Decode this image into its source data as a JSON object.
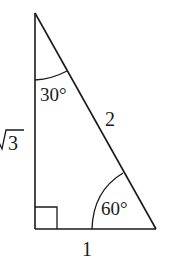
{
  "diagram": {
    "type": "right-triangle",
    "vertices": {
      "top": {
        "x": 35,
        "y": 13
      },
      "right_angle": {
        "x": 35,
        "y": 229
      },
      "bottom_right": {
        "x": 156,
        "y": 229
      }
    },
    "stroke_color": "#1a1a1a",
    "sides": {
      "vertical_leg": {
        "label": "√3",
        "radicand": "3"
      },
      "base": {
        "label": "1"
      },
      "hypotenuse": {
        "label": "2"
      }
    },
    "angles": {
      "top": {
        "label": "30°"
      },
      "bottom_right": {
        "label": "60°"
      },
      "right_angle": {
        "label": "90°",
        "marker": "square"
      }
    }
  }
}
